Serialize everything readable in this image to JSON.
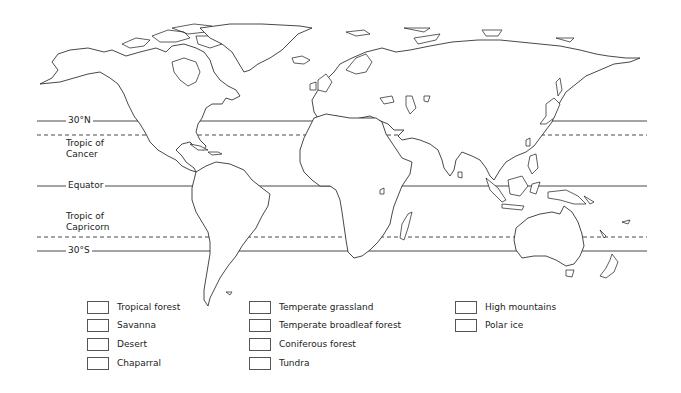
{
  "map": {
    "title": "World biomes blank map",
    "line_color": "#333333",
    "latitude_lines": [
      {
        "id": "30n",
        "label": "30°N",
        "style": "solid",
        "y": 121
      },
      {
        "id": "tropic-cancer",
        "label_line1": "Tropic of",
        "label_line2": "Cancer",
        "style": "dashed",
        "y": 135
      },
      {
        "id": "equator",
        "label": "Equator",
        "style": "solid",
        "y": 186
      },
      {
        "id": "tropic-capricorn",
        "label_line1": "Tropic of",
        "label_line2": "Capricorn",
        "style": "dashed",
        "y": 237
      },
      {
        "id": "30s",
        "label": "30°S",
        "style": "solid",
        "y": 251
      }
    ]
  },
  "legend": {
    "columns": [
      {
        "items": [
          {
            "label": "Tropical forest"
          },
          {
            "label": "Savanna"
          },
          {
            "label": "Desert"
          },
          {
            "label": "Chaparral"
          }
        ]
      },
      {
        "items": [
          {
            "label": "Temperate grassland"
          },
          {
            "label": "Temperate broadleaf forest"
          },
          {
            "label": "Coniferous forest"
          },
          {
            "label": "Tundra"
          }
        ]
      },
      {
        "items": [
          {
            "label": "High mountains"
          },
          {
            "label": "Polar ice"
          }
        ]
      }
    ]
  }
}
